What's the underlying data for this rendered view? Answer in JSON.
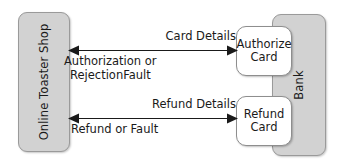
{
  "diagram": {
    "type": "collaboration-diagram",
    "title": "",
    "colors": {
      "actor_fill": "#d2d2d2",
      "actor_stroke": "#9a9a9a",
      "operation_fill": "#ffffff",
      "operation_stroke": "#8e8e8e",
      "arrow": "#1a1a1a",
      "text": "#1a1a1a",
      "background": "#ffffff"
    },
    "participants": [
      {
        "id": "online-toaster-shop",
        "label": "Online Toaster Shop",
        "orientation": "vertical",
        "side": "left"
      },
      {
        "id": "bank",
        "label": "Bank",
        "orientation": "vertical",
        "side": "right"
      }
    ],
    "operations": [
      {
        "id": "authorize-card",
        "line1": "Authorize",
        "line2": "Card",
        "owner": "bank"
      },
      {
        "id": "refund-card",
        "line1": "Refund",
        "line2": "Card",
        "owner": "bank"
      }
    ],
    "messages": [
      {
        "id": "authorize-exchange",
        "request_label": "Card Details",
        "request_direction": "shop-to-bank",
        "response_line1": "Authorization or",
        "response_line2": "RejectionFault",
        "response_direction": "bank-to-shop",
        "target": "authorize-card"
      },
      {
        "id": "refund-exchange",
        "request_label": "Refund Details",
        "request_direction": "shop-to-bank",
        "response_line1": "Refund or Fault",
        "response_line2": "",
        "response_direction": "bank-to-shop",
        "target": "refund-card"
      }
    ]
  }
}
